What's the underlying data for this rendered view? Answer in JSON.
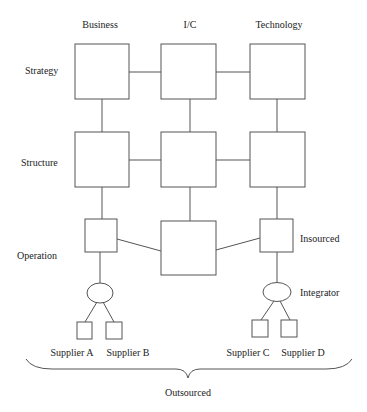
{
  "columns": {
    "business": "Business",
    "ic": "I/C",
    "technology": "Technology"
  },
  "rows": {
    "strategy": "Strategy",
    "structure": "Structure",
    "operation": "Operation"
  },
  "annotations": {
    "insourced": "Insourced",
    "integrator": "Integrator",
    "outsourced": "Outsourced"
  },
  "suppliers": [
    "Supplier A",
    "Supplier B",
    "Supplier C",
    "Supplier D"
  ],
  "colors": {
    "stroke": "#555555",
    "text": "#222222",
    "background": "#ffffff"
  }
}
